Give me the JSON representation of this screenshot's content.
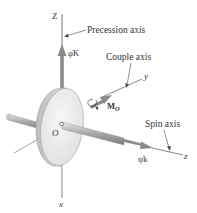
{
  "diagram": {
    "type": "gyroscope-free-body",
    "axes": {
      "Z": {
        "label": "Z",
        "role": "vertical fixed axis"
      },
      "y": {
        "label": "y"
      },
      "z": {
        "label": "z"
      },
      "x": {
        "label": "x"
      }
    },
    "callouts": {
      "precession": "Precession axis",
      "couple": "Couple axis",
      "spin": "Spin axis"
    },
    "vectors": {
      "precession_rate": "φ̇K",
      "moment": "M",
      "moment_sub": "O",
      "spin_rate": "ψ̇k"
    },
    "origin_label": "O",
    "colors": {
      "vector_gray": "#8a8a8a",
      "disk_face": "#eeeeee",
      "disk_rim": "#c8c8c8",
      "line": "#555555",
      "text": "#333333"
    }
  }
}
